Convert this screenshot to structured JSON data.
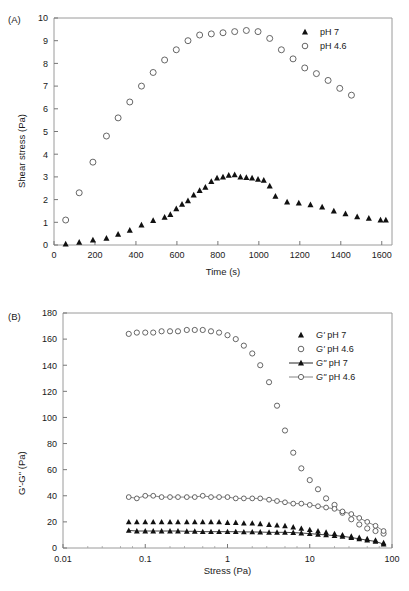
{
  "figure": {
    "panels": [
      {
        "tag": "(A)",
        "xlabel": "Time (s)",
        "ylabel": "Shear stress (Pa)",
        "xticks": [
          "0",
          "200",
          "400",
          "600",
          "800",
          "1000",
          "1200",
          "1400",
          "1600"
        ],
        "yticks": [
          "0",
          "1",
          "2",
          "3",
          "4",
          "5",
          "6",
          "7",
          "8",
          "9",
          "10"
        ],
        "legend": [
          {
            "marker": "filled-triangle",
            "label": "pH 7",
            "line": false
          },
          {
            "marker": "open-circle",
            "label": "pH 4.6",
            "line": false
          }
        ]
      },
      {
        "tag": "(B)",
        "xlabel": "Stress (Pa)",
        "ylabel": "G'-G\" (Pa)",
        "xticks": [
          "0.01",
          "0.1",
          "1",
          "10",
          "100"
        ],
        "yticks": [
          "0",
          "20",
          "40",
          "60",
          "80",
          "100",
          "120",
          "140",
          "160",
          "180"
        ],
        "legend": [
          {
            "marker": "filled-triangle",
            "label": "G' pH 7",
            "italic_prefix": "G'",
            "rest": " pH 7",
            "line": false
          },
          {
            "marker": "open-circle",
            "label": "G' pH 4.6",
            "italic_prefix": "G'",
            "rest": " pH 4.6",
            "line": false
          },
          {
            "marker": "filled-triangle",
            "label": "G\" pH 7",
            "italic_prefix": "G\"",
            "rest": " pH 7",
            "line": true
          },
          {
            "marker": "open-circle",
            "label": "G\" pH 4.6",
            "italic_prefix": "G\"",
            "rest": " pH 4.6",
            "line": true
          }
        ]
      }
    ]
  },
  "chart_data": [
    {
      "type": "scatter",
      "panel": "(A)",
      "title": "",
      "xlabel": "Time (s)",
      "ylabel": "Shear stress (Pa)",
      "xlim": [
        0,
        1650
      ],
      "ylim": [
        0,
        10
      ],
      "xticks": [
        0,
        200,
        400,
        600,
        800,
        1000,
        1200,
        1400,
        1600
      ],
      "yticks": [
        0,
        1,
        2,
        3,
        4,
        5,
        6,
        7,
        8,
        9,
        10
      ],
      "grid": false,
      "legend_position": "top-right",
      "series": [
        {
          "name": "pH 4.6",
          "marker": "open-circle",
          "x": [
            57,
            123,
            190,
            256,
            313,
            370,
            427,
            484,
            540,
            597,
            654,
            711,
            768,
            825,
            882,
            939,
            996,
            1053,
            1110,
            1167,
            1224,
            1281,
            1338,
            1395,
            1452
          ],
          "y": [
            1.1,
            2.3,
            3.65,
            4.8,
            5.6,
            6.3,
            7.0,
            7.6,
            8.15,
            8.6,
            9.0,
            9.25,
            9.3,
            9.35,
            9.4,
            9.45,
            9.4,
            9.1,
            8.6,
            8.2,
            7.8,
            7.55,
            7.25,
            6.9,
            6.6
          ]
        },
        {
          "name": "pH 7",
          "marker": "filled-triangle",
          "x": [
            57,
            123,
            190,
            256,
            313,
            370,
            427,
            484,
            540,
            568,
            597,
            625,
            654,
            682,
            711,
            739,
            768,
            796,
            825,
            853,
            882,
            910,
            939,
            967,
            996,
            1024,
            1053,
            1081,
            1138,
            1195,
            1252,
            1309,
            1366,
            1423,
            1480,
            1537,
            1594,
            1620
          ],
          "y": [
            0.05,
            0.12,
            0.22,
            0.3,
            0.48,
            0.65,
            0.88,
            1.08,
            1.22,
            1.35,
            1.6,
            1.8,
            1.95,
            2.2,
            2.4,
            2.55,
            2.8,
            2.95,
            3.0,
            3.08,
            3.1,
            3.0,
            2.98,
            2.95,
            2.9,
            2.85,
            2.6,
            2.15,
            1.9,
            1.85,
            1.78,
            1.68,
            1.5,
            1.38,
            1.25,
            1.18,
            1.1,
            1.1
          ]
        }
      ]
    },
    {
      "type": "scatter",
      "panel": "(B)",
      "title": "",
      "xlabel": "Stress (Pa)",
      "ylabel": "G'-G\" (Pa)",
      "xlim": [
        0.01,
        100
      ],
      "ylim": [
        0,
        180
      ],
      "xscale": "log",
      "xticks": [
        0.01,
        0.1,
        1,
        10,
        100
      ],
      "yticks": [
        0,
        20,
        40,
        60,
        80,
        100,
        120,
        140,
        160,
        180
      ],
      "grid": false,
      "legend_position": "top-right",
      "series": [
        {
          "name": "G' pH 4.6",
          "marker": "open-circle",
          "line": false,
          "x": [
            0.063,
            0.079,
            0.1,
            0.125,
            0.158,
            0.2,
            0.25,
            0.32,
            0.4,
            0.5,
            0.63,
            0.79,
            1.0,
            1.26,
            1.58,
            2.0,
            2.5,
            3.2,
            4.0,
            5.0,
            6.3,
            7.9,
            10.0,
            12.6,
            15.8,
            20.0,
            25.0,
            32.0,
            40.0,
            50.0,
            63.0,
            79.0
          ],
          "y": [
            164,
            165,
            165,
            165,
            166,
            166,
            166,
            167,
            167,
            167,
            166,
            165,
            163,
            160,
            155,
            149,
            140,
            127,
            109,
            90,
            73,
            61,
            52,
            45,
            38,
            33,
            27,
            22,
            18,
            15,
            13,
            11
          ]
        },
        {
          "name": "G\" pH 4.6",
          "marker": "open-circle",
          "line": true,
          "x": [
            0.063,
            0.079,
            0.1,
            0.125,
            0.158,
            0.2,
            0.25,
            0.32,
            0.4,
            0.5,
            0.63,
            0.79,
            1.0,
            1.26,
            1.58,
            2.0,
            2.5,
            3.2,
            4.0,
            5.0,
            6.3,
            7.9,
            10.0,
            12.6,
            15.8,
            20.0,
            25.0,
            32.0,
            40.0,
            50.0,
            63.0,
            79.0
          ],
          "y": [
            39,
            38,
            40,
            40,
            39,
            39,
            39,
            39,
            39,
            40,
            39,
            39,
            39,
            38,
            38,
            38,
            38,
            37,
            36,
            35,
            34,
            34,
            33,
            32,
            31,
            30,
            28,
            26,
            23,
            20,
            17,
            13
          ]
        },
        {
          "name": "G' pH 7",
          "marker": "filled-triangle",
          "line": false,
          "x": [
            0.063,
            0.079,
            0.1,
            0.125,
            0.158,
            0.2,
            0.25,
            0.32,
            0.4,
            0.5,
            0.63,
            0.79,
            1.0,
            1.26,
            1.58,
            2.0,
            2.5,
            3.2,
            4.0,
            5.0,
            6.3,
            7.9,
            10.0,
            12.6,
            15.8,
            20.0,
            25.0,
            32.0,
            40.0,
            50.0,
            63.0,
            79.0
          ],
          "y": [
            20,
            20,
            20,
            20,
            20,
            20,
            20,
            20,
            20,
            20,
            20,
            20,
            19.5,
            19.5,
            19,
            19,
            18.5,
            18,
            17.5,
            17,
            16,
            15,
            14,
            13,
            12,
            11,
            10,
            9,
            8,
            7,
            6,
            4
          ]
        },
        {
          "name": "G\" pH 7",
          "marker": "filled-triangle",
          "line": true,
          "x": [
            0.063,
            0.079,
            0.1,
            0.125,
            0.158,
            0.2,
            0.25,
            0.32,
            0.4,
            0.5,
            0.63,
            0.79,
            1.0,
            1.26,
            1.58,
            2.0,
            2.5,
            3.2,
            4.0,
            5.0,
            6.3,
            7.9,
            10.0,
            12.6,
            15.8,
            20.0,
            25.0,
            32.0,
            40.0,
            50.0,
            63.0,
            79.0
          ],
          "y": [
            13.5,
            13,
            13,
            13,
            13,
            13,
            13,
            12.8,
            12.8,
            12.5,
            12.5,
            12.5,
            12.5,
            12.5,
            12.3,
            12.3,
            12.2,
            12,
            12,
            12,
            11.8,
            11.5,
            11,
            10.5,
            10,
            9.5,
            9,
            8,
            7,
            6,
            5,
            3
          ]
        }
      ]
    }
  ]
}
